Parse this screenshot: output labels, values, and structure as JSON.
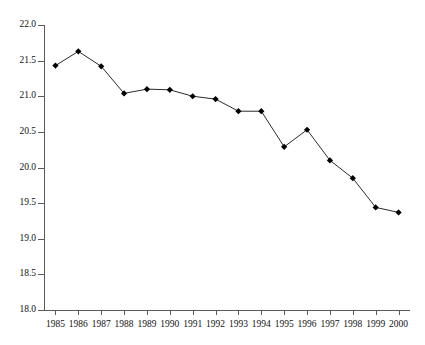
{
  "chart_data": {
    "type": "line",
    "title": "",
    "title_note": "title row is clipped off the top edge of the screenshot and is not legible",
    "xlabel": "",
    "ylabel": "",
    "categories": [
      "1985",
      "1986",
      "1987",
      "1988",
      "1989",
      "1990",
      "1991",
      "1992",
      "1993",
      "1994",
      "1995",
      "1996",
      "1997",
      "1998",
      "1999",
      "2000"
    ],
    "values": [
      21.43,
      21.63,
      21.42,
      21.04,
      21.1,
      21.09,
      21.0,
      20.96,
      20.79,
      20.79,
      20.29,
      20.53,
      20.1,
      19.85,
      19.44,
      19.37
    ],
    "series": [
      {
        "name": "series-1",
        "values": [
          21.43,
          21.63,
          21.42,
          21.04,
          21.1,
          21.09,
          21.0,
          20.96,
          20.79,
          20.79,
          20.29,
          20.53,
          20.1,
          19.85,
          19.44,
          19.37
        ]
      }
    ],
    "ylim": [
      18.0,
      22.0
    ],
    "y_ticks": [
      "18.0",
      "18.5",
      "19.0",
      "19.5",
      "20.0",
      "20.5",
      "21.0",
      "21.5",
      "22.0"
    ],
    "y_tick_values": [
      18.0,
      18.5,
      19.0,
      19.5,
      20.0,
      20.5,
      21.0,
      21.5,
      22.0
    ],
    "x_tick_labels": [
      "1985",
      "1986",
      "1987",
      "1988",
      "1989",
      "1990",
      "1991",
      "1992",
      "1993",
      "1994",
      "1995",
      "1996",
      "1997",
      "1998",
      "1999",
      "2000"
    ],
    "grid": false,
    "legend": null,
    "legend_position": "none",
    "marker": "diamond",
    "marker_color": "#000000",
    "line_color": "#2b2b2b",
    "axis_color": "#5a5a5a",
    "background_color": "#ffffff"
  }
}
